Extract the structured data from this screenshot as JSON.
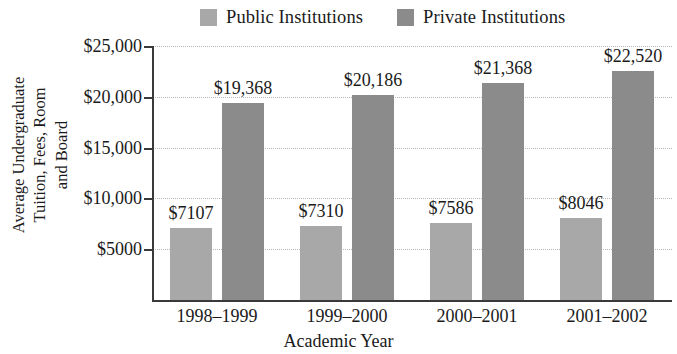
{
  "chart_data": {
    "type": "bar",
    "title": "",
    "xlabel": "Academic Year",
    "ylabel": "Average Undergraduate Tuition, Fees, Room and Board",
    "categories": [
      "1998–1999",
      "1999–2000",
      "2000–2001",
      "2001–2002"
    ],
    "series": [
      {
        "name": "Public Institutions",
        "color": "#a8a8a8",
        "values": [
          7107,
          7310,
          7586,
          8046
        ],
        "labels": [
          "$7107",
          "$7310",
          "$7586",
          "$8046"
        ]
      },
      {
        "name": "Private Institutions",
        "color": "#8b8b8b",
        "values": [
          19368,
          20186,
          21368,
          22520
        ],
        "labels": [
          "$19,368",
          "$20,186",
          "$21,368",
          "$22,520"
        ]
      }
    ],
    "ylim": [
      0,
      25000
    ],
    "yticks": [
      5000,
      10000,
      15000,
      20000,
      25000
    ],
    "ytick_labels": [
      "$5000",
      "$10,000",
      "$15,000",
      "$20,000",
      "$25,000"
    ],
    "grid": true,
    "legend_position": "top"
  },
  "legend": {
    "entries": [
      {
        "label": "Public Institutions"
      },
      {
        "label": "Private Institutions"
      }
    ]
  },
  "axes": {
    "y_title_lines": [
      "Average Undergraduate",
      "Tuition, Fees, Room",
      "and Board"
    ],
    "x_title": "Academic Year"
  }
}
